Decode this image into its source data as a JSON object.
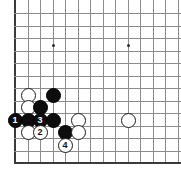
{
  "diagram": {
    "type": "go-board-diagram",
    "board": {
      "origin_x": 15,
      "origin_y": 13,
      "cell": 12.5,
      "cols": 14,
      "rows": 12,
      "left_edge_is_border": true,
      "bottom_edge_is_border": true,
      "line_color": "#8c8c8c",
      "border_color": "#3a3a3a",
      "background": "#ffffff"
    },
    "star_points": [
      {
        "x": 53,
        "y": 45
      },
      {
        "x": 128,
        "y": 45
      }
    ],
    "stone_colors": {
      "black_fill": "#0d0d0d",
      "black_label": "#ffffff",
      "white_fill": "#ffffff",
      "white_label": "#111111",
      "white_outline": "#1a1a1a"
    },
    "stone_diameter": 15,
    "stones": [
      {
        "id": "w-a",
        "color": "white",
        "label": "",
        "x": 28,
        "y": 95
      },
      {
        "id": "b-a",
        "color": "black",
        "label": "",
        "x": 53,
        "y": 95
      },
      {
        "id": "w-b",
        "color": "white",
        "label": "",
        "x": 28,
        "y": 107
      },
      {
        "id": "b-b",
        "color": "black",
        "label": "",
        "x": 40,
        "y": 107
      },
      {
        "id": "b-1",
        "color": "black",
        "label": "1",
        "x": 15,
        "y": 120
      },
      {
        "id": "b-c",
        "color": "black",
        "label": "",
        "x": 28,
        "y": 120
      },
      {
        "id": "b-3",
        "color": "black",
        "label": "3",
        "x": 40,
        "y": 120
      },
      {
        "id": "b-d",
        "color": "black",
        "label": "",
        "x": 53,
        "y": 120
      },
      {
        "id": "w-c",
        "color": "white",
        "label": "",
        "x": 78,
        "y": 120
      },
      {
        "id": "w-d",
        "color": "white",
        "label": "",
        "x": 128,
        "y": 120
      },
      {
        "id": "w-e",
        "color": "white",
        "label": "",
        "x": 28,
        "y": 132
      },
      {
        "id": "w-2",
        "color": "white",
        "label": "2",
        "x": 40,
        "y": 132
      },
      {
        "id": "b-e",
        "color": "black",
        "label": "",
        "x": 65,
        "y": 132
      },
      {
        "id": "w-f",
        "color": "white",
        "label": "",
        "x": 78,
        "y": 132
      },
      {
        "id": "w-4",
        "color": "white",
        "label": "4",
        "x": 65,
        "y": 145
      }
    ]
  }
}
